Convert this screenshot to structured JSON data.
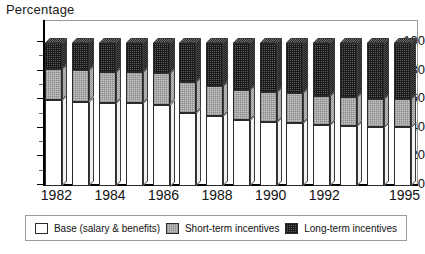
{
  "chart_data": {
    "type": "bar",
    "title": "",
    "ylabel": "Percentage",
    "xlabel": "",
    "ylim": [
      0,
      100
    ],
    "yticks": [
      0,
      20,
      40,
      60,
      80,
      100
    ],
    "grid": false,
    "stacked": true,
    "legend_position": "bottom",
    "categories": [
      "1982",
      "1983",
      "1984",
      "1985",
      "1986",
      "1987",
      "1988",
      "1989",
      "1990",
      "1991",
      "1992",
      "1993",
      "1994",
      "1995"
    ],
    "visible_tick_labels": [
      "1982",
      "1984",
      "1986",
      "1988",
      "1990",
      "1992",
      "1995"
    ],
    "series": [
      {
        "name": "Base (salary & benefits)",
        "color": "#ffffff",
        "values": [
          60,
          59,
          58,
          58,
          57,
          51,
          49,
          46,
          45,
          44,
          43,
          42,
          41,
          41
        ]
      },
      {
        "name": "Short-term incentives",
        "color": "#c9c9c9",
        "values": [
          22,
          22,
          22,
          22,
          22,
          22,
          21,
          21,
          21,
          21,
          20,
          20,
          20,
          20
        ]
      },
      {
        "name": "Long-term incentives",
        "color": "#5c5c5c",
        "values": [
          18,
          19,
          20,
          20,
          21,
          27,
          30,
          33,
          34,
          35,
          37,
          38,
          39,
          39
        ]
      }
    ]
  },
  "axis": {
    "y_title": "Percentage",
    "y_tick_labels": [
      "100",
      "80",
      "60",
      "40",
      "20",
      "0"
    ]
  },
  "legend": {
    "items": [
      {
        "label": "Base (salary & benefits)",
        "swatch": "base-swatch"
      },
      {
        "label": "Short-term incentives",
        "swatch": "short-term-swatch"
      },
      {
        "label": "Long-term incentives",
        "swatch": "long-term-swatch"
      }
    ]
  }
}
